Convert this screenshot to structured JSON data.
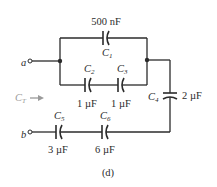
{
  "figure_label": "(d)",
  "terminals": {
    "a": "a",
    "b": "b"
  },
  "total_label": {
    "main": "C",
    "sub": "T"
  },
  "capacitors": [
    {
      "id": "C1",
      "name": "C",
      "sub": "1",
      "value": "500 nF"
    },
    {
      "id": "C2",
      "name": "C",
      "sub": "2",
      "value": "1 µF"
    },
    {
      "id": "C3",
      "name": "C",
      "sub": "3",
      "value": "1 µF"
    },
    {
      "id": "C4",
      "name": "C",
      "sub": "4",
      "value": "2 µF"
    },
    {
      "id": "C5",
      "name": "C",
      "sub": "5",
      "value": "3 µF"
    },
    {
      "id": "C6",
      "name": "C",
      "sub": "6",
      "value": "6 µF"
    }
  ],
  "colors": {
    "line": "#2b2b2b",
    "annotation": "#9a9a9a"
  }
}
